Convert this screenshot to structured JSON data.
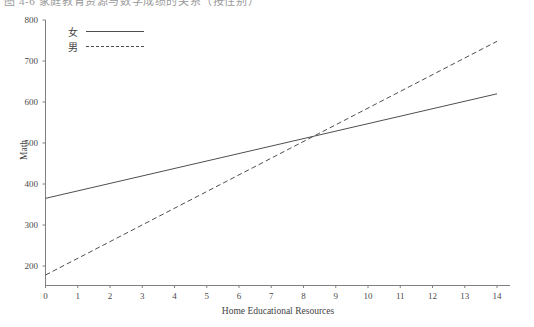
{
  "caption": {
    "clipped_text": "图 4-6  家庭教育资源与数学成绩的关系（按性别）"
  },
  "chart_data": {
    "type": "line",
    "title": "",
    "xlabel": "Home Educational Resources",
    "ylabel": "Math",
    "xlim": [
      0,
      14
    ],
    "ylim": [
      170,
      800
    ],
    "grid": false,
    "legend_position": "top-left",
    "xticks": [
      "0",
      "1",
      "2",
      "3",
      "4",
      "5",
      "6",
      "7",
      "8",
      "9",
      "10",
      "11",
      "12",
      "13",
      "14"
    ],
    "yticks": [
      "200",
      "300",
      "400",
      "500",
      "600",
      "700",
      "800"
    ],
    "series": [
      {
        "name": "女",
        "style": "solid",
        "color": "#4f4f4f",
        "x": [
          0,
          14
        ],
        "values": [
          365,
          620
        ],
        "slope": 18.2,
        "intercept": 365
      },
      {
        "name": "男",
        "style": "dashed",
        "color": "#4f4f4f",
        "x": [
          0,
          14
        ],
        "values": [
          178,
          748
        ],
        "slope": 40.7,
        "intercept": 178
      }
    ],
    "annotations": [
      {
        "label": "crossover",
        "x": 8.45,
        "y": 515
      }
    ]
  },
  "legend": {
    "items": [
      {
        "label": "女",
        "style": "solid"
      },
      {
        "label": "男",
        "style": "dashed"
      }
    ]
  }
}
